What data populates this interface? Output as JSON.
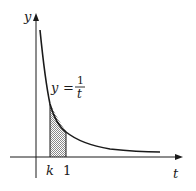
{
  "diagram": {
    "type": "function-graph",
    "function": "y = 1/t",
    "axes": {
      "x_label": "t",
      "y_label": "y"
    },
    "curve_label": {
      "lhs": "y",
      "equals": "=",
      "numerator": "1",
      "denominator": "t"
    },
    "shaded_region": {
      "from_label": "k",
      "to_label": "1",
      "description": "area under y = 1/t from t = k to t = 1"
    },
    "tick_labels": [
      "k",
      "1"
    ],
    "colors": {
      "stroke": "#1a1a1a",
      "shading": "#9a9a9a",
      "background": "#ffffff"
    }
  }
}
